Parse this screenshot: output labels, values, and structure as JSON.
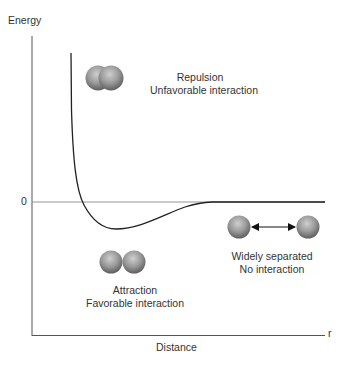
{
  "diagram": {
    "y_axis_label": "Energy",
    "x_axis_label": "Distance",
    "x_axis_symbol": "r",
    "zero_label": "0",
    "regions": [
      {
        "id": "repulsion",
        "line1": "Repulsion",
        "line2": "Unfavorable interaction"
      },
      {
        "id": "attraction",
        "line1": "Attraction",
        "line2": "Favorable interaction"
      },
      {
        "id": "separated",
        "line1": "Widely separated",
        "line2": "No interaction"
      }
    ],
    "colors": {
      "axis": "#555555",
      "curve": "#333333",
      "zero_line": "#777777",
      "atom_light": "#d0d0d0",
      "atom_dark": "#6a6a6a",
      "text": "#333333"
    }
  }
}
